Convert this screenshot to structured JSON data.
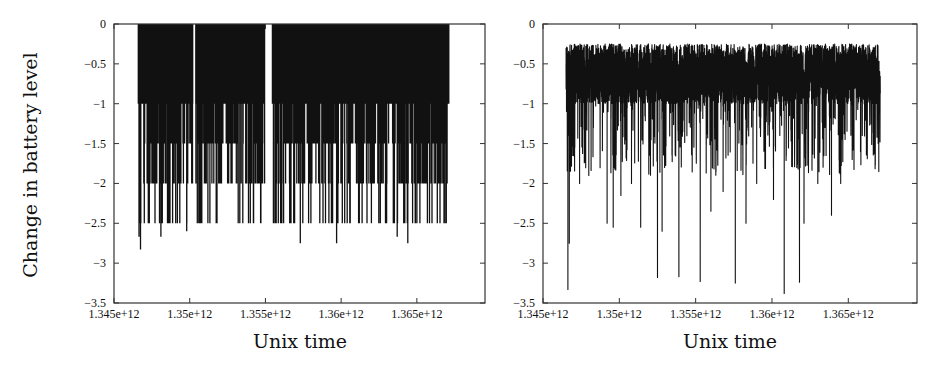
{
  "chart_data": [
    {
      "type": "line",
      "title": "",
      "xlabel": "Unix time",
      "ylabel": "Change in battery level",
      "xlim": [
        1345000000000.0,
        1369500000000.0
      ],
      "ylim": [
        -3.5,
        0
      ],
      "grid": false,
      "legend": null,
      "xticks": [
        "1.345e+12",
        "1.35e+12",
        "1.355e+12",
        "1.36e+12",
        "1.365e+12"
      ],
      "xtick_values": [
        1345000000000.0,
        1350000000000.0,
        1355000000000.0,
        1360000000000.0,
        1365000000000.0
      ],
      "yticks": [
        "0",
        "-0.5",
        "-1",
        "-1.5",
        "-2",
        "-2.5",
        "-3",
        "-3.5"
      ],
      "ytick_values": [
        0,
        -0.5,
        -1,
        -1.5,
        -2,
        -2.5,
        -3,
        -3.5
      ],
      "description": "Dense discrete spikes from 0 down to quantized levels (-0.5, -1, -1.5, -2, -2.5); data spans ~1.3466e12 to ~1.3671e12 with a gap near 1.3550e12-1.3555e12",
      "x_range": [
        1346600000000.0,
        1367100000000.0
      ],
      "gaps": [
        [
          1354950000000.0,
          1355450000000.0
        ],
        [
          1350200000000.0,
          1350400000000.0
        ]
      ],
      "min_value": -2.83,
      "spike_samples": [
        {
          "x": 1346650000000.0,
          "y": -2.67
        },
        {
          "x": 1346750000000.0,
          "y": -2.83
        },
        {
          "x": 1347000000000.0,
          "y": -2.5
        },
        {
          "x": 1347500000000.0,
          "y": -2.0
        },
        {
          "x": 1348100000000.0,
          "y": -2.67
        },
        {
          "x": 1348700000000.0,
          "y": -2.5
        },
        {
          "x": 1349300000000.0,
          "y": -2.0
        },
        {
          "x": 1349800000000.0,
          "y": -2.6
        },
        {
          "x": 1350600000000.0,
          "y": -2.5
        },
        {
          "x": 1351200000000.0,
          "y": -2.5
        },
        {
          "x": 1351800000000.0,
          "y": -2.5
        },
        {
          "x": 1352500000000.0,
          "y": -2.0
        },
        {
          "x": 1353200000000.0,
          "y": -2.5
        },
        {
          "x": 1354000000000.0,
          "y": -2.5
        },
        {
          "x": 1354700000000.0,
          "y": -2.5
        },
        {
          "x": 1356000000000.0,
          "y": -2.5
        },
        {
          "x": 1356600000000.0,
          "y": -2.5
        },
        {
          "x": 1357300000000.0,
          "y": -2.75
        },
        {
          "x": 1358000000000.0,
          "y": -2.5
        },
        {
          "x": 1358800000000.0,
          "y": -2.5
        },
        {
          "x": 1359700000000.0,
          "y": -2.75
        },
        {
          "x": 1360400000000.0,
          "y": -2.5
        },
        {
          "x": 1361200000000.0,
          "y": -2.5
        },
        {
          "x": 1362000000000.0,
          "y": -2.5
        },
        {
          "x": 1363000000000.0,
          "y": -2.5
        },
        {
          "x": 1363700000000.0,
          "y": -2.67
        },
        {
          "x": 1364400000000.0,
          "y": -2.75
        },
        {
          "x": 1365200000000.0,
          "y": -2.5
        },
        {
          "x": 1366000000000.0,
          "y": -2.5
        },
        {
          "x": 1366600000000.0,
          "y": -2.0
        },
        {
          "x": 1367000000000.0,
          "y": -2.0
        }
      ]
    },
    {
      "type": "line",
      "title": "",
      "xlabel": "Unix time",
      "ylabel": "",
      "xlim": [
        1345000000000.0,
        1369500000000.0
      ],
      "ylim": [
        -3.5,
        0
      ],
      "grid": false,
      "legend": null,
      "xticks": [
        "1.345e+12",
        "1.35e+12",
        "1.355e+12",
        "1.36e+12",
        "1.365e+12"
      ],
      "xtick_values": [
        1345000000000.0,
        1350000000000.0,
        1355000000000.0,
        1360000000000.0,
        1365000000000.0
      ],
      "yticks": [
        "0",
        "-0.5",
        "-1",
        "-1.5",
        "-2",
        "-2.5",
        "-3",
        "-3.5"
      ],
      "ytick_values": [
        0,
        -0.5,
        -1,
        -1.5,
        -2,
        -2.5,
        -3,
        -3.5
      ],
      "description": "Continuous noisy series fluctuating mostly between -0.25 and -1.0 (mean ~-0.6) with occasional deep downward spikes",
      "x_range": [
        1346500000000.0,
        1367100000000.0
      ],
      "baseline_band": [
        -1.0,
        -0.25
      ],
      "min_value": -3.38,
      "deep_spikes": [
        {
          "x": 1346630000000.0,
          "y": -3.33
        },
        {
          "x": 1346720000000.0,
          "y": -2.75
        },
        {
          "x": 1347400000000.0,
          "y": -2.0
        },
        {
          "x": 1348000000000.0,
          "y": -1.9
        },
        {
          "x": 1349200000000.0,
          "y": -2.5
        },
        {
          "x": 1349600000000.0,
          "y": -2.55
        },
        {
          "x": 1350100000000.0,
          "y": -2.15
        },
        {
          "x": 1350800000000.0,
          "y": -2.0
        },
        {
          "x": 1351400000000.0,
          "y": -2.55
        },
        {
          "x": 1352500000000.0,
          "y": -3.18
        },
        {
          "x": 1352800000000.0,
          "y": -2.6
        },
        {
          "x": 1353900000000.0,
          "y": -3.17
        },
        {
          "x": 1355300000000.0,
          "y": -3.23
        },
        {
          "x": 1356000000000.0,
          "y": -2.35
        },
        {
          "x": 1356800000000.0,
          "y": -2.1
        },
        {
          "x": 1357600000000.0,
          "y": -3.25
        },
        {
          "x": 1358300000000.0,
          "y": -2.5
        },
        {
          "x": 1359000000000.0,
          "y": -2.0
        },
        {
          "x": 1360100000000.0,
          "y": -2.2
        },
        {
          "x": 1360800000000.0,
          "y": -3.38
        },
        {
          "x": 1361800000000.0,
          "y": -3.24
        },
        {
          "x": 1362100000000.0,
          "y": -2.5
        },
        {
          "x": 1363000000000.0,
          "y": -2.0
        },
        {
          "x": 1363900000000.0,
          "y": -2.4
        },
        {
          "x": 1364500000000.0,
          "y": -2.0
        },
        {
          "x": 1365800000000.0,
          "y": -1.6
        },
        {
          "x": 1367000000000.0,
          "y": -1.85
        }
      ]
    }
  ],
  "charts": [
    {
      "xlabel": "Unix time",
      "ylabel": "Change in battery level"
    },
    {
      "xlabel": "Unix time"
    }
  ],
  "colors": {
    "line": "#111111",
    "axis": "#333333",
    "background": "#ffffff"
  }
}
